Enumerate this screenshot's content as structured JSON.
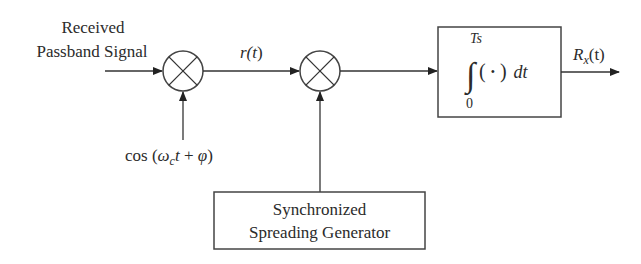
{
  "diagram": {
    "input_label": {
      "line1": "Received",
      "line2": "Passband Signal"
    },
    "carrier_label": {
      "prefix": "cos (",
      "omega": "ω",
      "omega_sub": "c",
      "t": "t",
      "plus": " + ",
      "phi": "φ",
      "suffix": ")"
    },
    "intermediate_signal": {
      "base": "r(",
      "arg": "t",
      "close": ")"
    },
    "integrator": {
      "upper_limit": "Ts",
      "lower_limit": "0",
      "integral_sign": "∫",
      "open_paren": "(",
      "dot": "•",
      "close_paren": ")",
      "differential": "dt"
    },
    "output_label": {
      "base": "R",
      "sub": "x",
      "arg": "(t)"
    },
    "generator_box": {
      "line1": "Synchronized",
      "line2": "Spreading Generator"
    },
    "mixers": [
      {
        "name": "carrier-mixer",
        "symbol": "multiply-icon"
      },
      {
        "name": "despreading-mixer",
        "symbol": "multiply-icon"
      }
    ],
    "colors": {
      "stroke": "#333333",
      "text": "#2b2b2b",
      "background": "#ffffff"
    }
  }
}
